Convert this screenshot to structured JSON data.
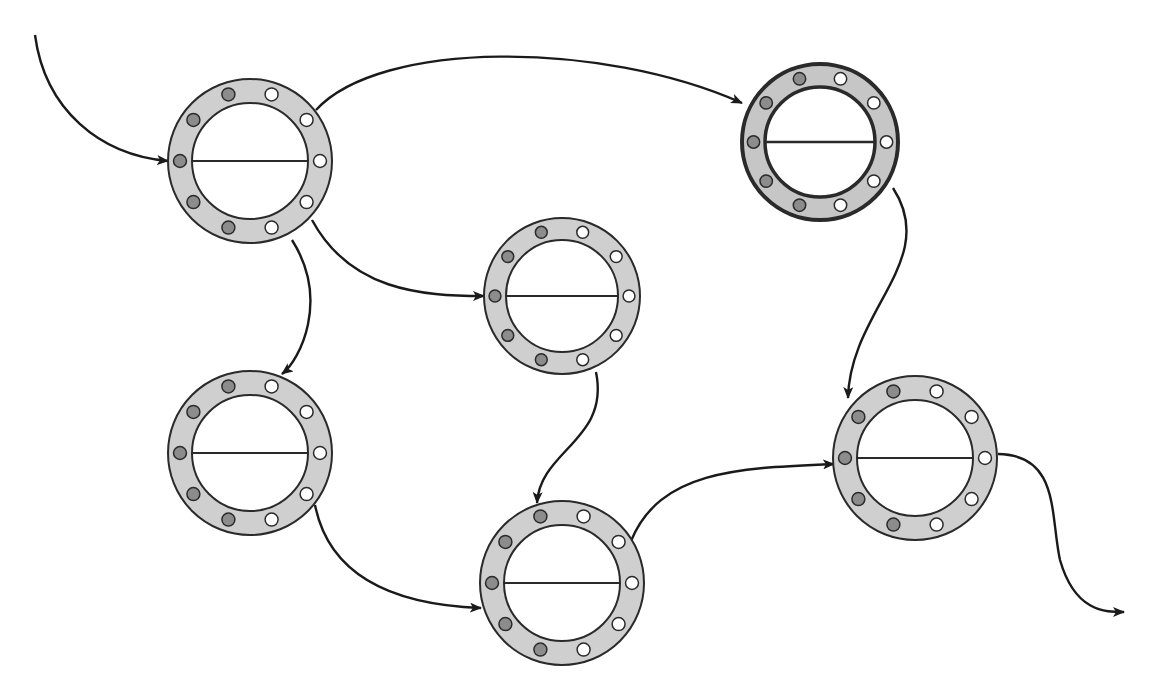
{
  "diagram": {
    "type": "directed-graph",
    "colors": {
      "ring_fill": "#cfcfcf",
      "ring_stroke": "#2a2a2a",
      "dark_dot": "#8c8c8c",
      "light_dot": "#ffffff",
      "edge": "#1a1a1a",
      "background": "#ffffff"
    },
    "nodes": [
      {
        "id": "n1",
        "cx": 250,
        "cy": 161,
        "r": 82,
        "inner_r": 58,
        "emphasized": false,
        "dark_dots": 5,
        "light_dots": 5
      },
      {
        "id": "n2",
        "cx": 820,
        "cy": 142,
        "r": 78,
        "inner_r": 55,
        "emphasized": true,
        "dark_dots": 5,
        "light_dots": 5
      },
      {
        "id": "n3",
        "cx": 562,
        "cy": 296,
        "r": 78,
        "inner_r": 56,
        "emphasized": false,
        "dark_dots": 5,
        "light_dots": 5
      },
      {
        "id": "n4",
        "cx": 250,
        "cy": 453,
        "r": 82,
        "inner_r": 58,
        "emphasized": false,
        "dark_dots": 5,
        "light_dots": 5
      },
      {
        "id": "n5",
        "cx": 562,
        "cy": 583,
        "r": 82,
        "inner_r": 58,
        "emphasized": false,
        "dark_dots": 5,
        "light_dots": 5
      },
      {
        "id": "n6",
        "cx": 915,
        "cy": 458,
        "r": 82,
        "inner_r": 58,
        "emphasized": false,
        "dark_dots": 5,
        "light_dots": 5
      }
    ],
    "edges": [
      {
        "id": "e-in",
        "from": "start",
        "to": "n1",
        "path": "M35,35 C45,110 100,155 168,161"
      },
      {
        "id": "e1-2",
        "from": "n1",
        "to": "n2",
        "path": "M316,110 C380,40 600,40 742,103"
      },
      {
        "id": "e1-3",
        "from": "n1",
        "to": "n3",
        "path": "M312,220 C350,290 420,296 484,296"
      },
      {
        "id": "e1-4",
        "from": "n1",
        "to": "n4",
        "path": "M292,240 C330,300 300,360 282,374"
      },
      {
        "id": "e2-6",
        "from": "n2",
        "to": "n6",
        "path": "M893,188 C940,260 850,310 848,398"
      },
      {
        "id": "e3-5",
        "from": "n3",
        "to": "n5",
        "path": "M596,372 C610,440 540,450 537,503"
      },
      {
        "id": "e4-5",
        "from": "n4",
        "to": "n5",
        "path": "M315,505 C330,580 400,605 481,608"
      },
      {
        "id": "e5-6",
        "from": "n5",
        "to": "n6",
        "path": "M631,541 C660,470 740,468 834,464"
      },
      {
        "id": "e-out",
        "from": "n6",
        "to": "end",
        "path": "M998,454 C1060,455 1050,515 1060,560 C1075,612 1105,612 1124,612"
      }
    ]
  }
}
